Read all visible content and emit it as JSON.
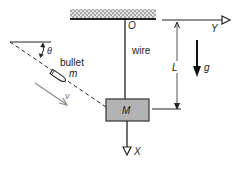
{
  "diagram": {
    "type": "physics-ballistic-pendulum",
    "labels": {
      "origin": "O",
      "wire": "wire",
      "length": "L",
      "gravity": "g",
      "y_axis": "Y",
      "x_axis": "X",
      "block_mass": "M",
      "bullet": "bullet",
      "bullet_mass": "m",
      "angle": "θ",
      "velocity": "v"
    },
    "colors": {
      "line": "#222222",
      "block_fill": "#b3b3b3",
      "ceiling_hatch": "#c8c8c8",
      "velocity_arrow": "#8a8a8a"
    }
  }
}
